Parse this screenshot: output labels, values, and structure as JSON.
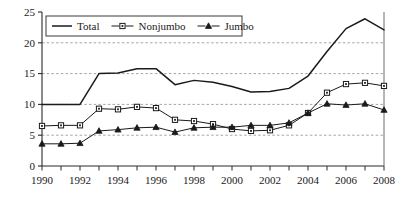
{
  "chart_data": {
    "type": "line",
    "title": "",
    "subtitle": "",
    "xlabel": "",
    "ylabel": "",
    "xlim": [
      1990,
      2008
    ],
    "ylim": [
      0,
      25
    ],
    "yticks": [
      0,
      5,
      10,
      15,
      20,
      25
    ],
    "ytick_labels": [
      "0",
      "5",
      "10",
      "15",
      "20",
      "25"
    ],
    "xticks": [
      1990,
      1991,
      1992,
      1993,
      1994,
      1995,
      1996,
      1997,
      1998,
      1999,
      2000,
      2001,
      2002,
      2003,
      2004,
      2005,
      2006,
      2007,
      2008
    ],
    "xtick_labels": [
      "1990",
      "",
      "1992",
      "",
      "1994",
      "",
      "1996",
      "",
      "1998",
      "",
      "2000",
      "",
      "2002",
      "",
      "2004",
      "",
      "2006",
      "",
      "2008"
    ],
    "x": [
      1990,
      1991,
      1992,
      1993,
      1994,
      1995,
      1996,
      1997,
      1998,
      1999,
      2000,
      2001,
      2002,
      2003,
      2004,
      2005,
      2006,
      2007,
      2008
    ],
    "grid": "horizontal-dashed",
    "gridlines_at": [
      5,
      10,
      15,
      20
    ],
    "legend_position": "top-center",
    "series": [
      {
        "name": "Total",
        "marker": "none",
        "color": "#1a1a1a",
        "values": [
          10.0,
          10.0,
          10.0,
          15.0,
          15.1,
          15.8,
          15.8,
          13.2,
          13.9,
          13.6,
          12.9,
          12.0,
          12.1,
          12.6,
          14.6,
          18.6,
          22.3,
          23.9,
          22.1
        ]
      },
      {
        "name": "Nonjumbo",
        "marker": "square",
        "color": "#1a1a1a",
        "values": [
          6.5,
          6.6,
          6.6,
          9.3,
          9.2,
          9.6,
          9.4,
          7.5,
          7.3,
          6.8,
          6.0,
          5.7,
          5.8,
          6.6,
          8.6,
          11.9,
          13.3,
          13.5,
          13.0
        ]
      },
      {
        "name": "Jumbo",
        "marker": "triangle",
        "color": "#1a1a1a",
        "values": [
          3.6,
          3.6,
          3.7,
          5.7,
          5.9,
          6.2,
          6.3,
          5.5,
          6.2,
          6.3,
          6.3,
          6.6,
          6.6,
          7.0,
          8.6,
          10.1,
          9.9,
          10.1,
          9.1
        ]
      }
    ],
    "legend": [
      {
        "label": "Total",
        "marker": "none"
      },
      {
        "label": "Nonjumbo",
        "marker": "square"
      },
      {
        "label": "Jumbo",
        "marker": "triangle"
      }
    ]
  }
}
